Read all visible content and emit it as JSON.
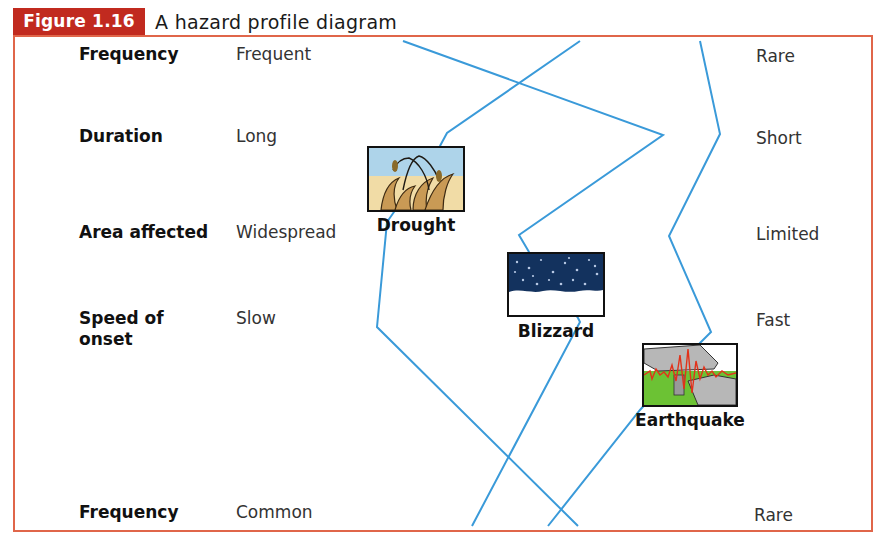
{
  "figure": {
    "number": "Figure 1.16",
    "title": "A hazard profile diagram",
    "accent_color": "#c12a1f",
    "frame_color": "#e0664a",
    "line_color": "#3a9ad9"
  },
  "rows": [
    {
      "criterion": "Frequency",
      "left": "Frequent",
      "right": "Rare"
    },
    {
      "criterion": "Duration",
      "left": "Long",
      "right": "Short"
    },
    {
      "criterion": "Area affected",
      "left": "Widespread",
      "right": "Limited"
    },
    {
      "criterion": "Speed of onset",
      "left": "Slow",
      "right": "Fast"
    },
    {
      "criterion": "Frequency",
      "left": "Common",
      "right": "Rare"
    }
  ],
  "hazards": [
    {
      "name": "Drought",
      "icon": "drought-icon"
    },
    {
      "name": "Blizzard",
      "icon": "blizzard-icon"
    },
    {
      "name": "Earthquake",
      "icon": "earthquake-icon"
    }
  ],
  "profiles": {
    "drought": [
      [
        580,
        41
      ],
      [
        447,
        133
      ],
      [
        440,
        146
      ],
      [
        387,
        222
      ],
      [
        377,
        327
      ],
      [
        578,
        526
      ]
    ],
    "blizzard": [
      [
        403,
        41
      ],
      [
        663,
        135
      ],
      [
        519,
        235
      ],
      [
        529,
        252
      ],
      [
        578,
        318
      ],
      [
        580,
        322
      ],
      [
        472,
        526
      ]
    ],
    "earthquake": [
      [
        700,
        41
      ],
      [
        720,
        134
      ],
      [
        669,
        236
      ],
      [
        711,
        332
      ],
      [
        700,
        343
      ],
      [
        640,
        410
      ],
      [
        548,
        526
      ]
    ]
  }
}
